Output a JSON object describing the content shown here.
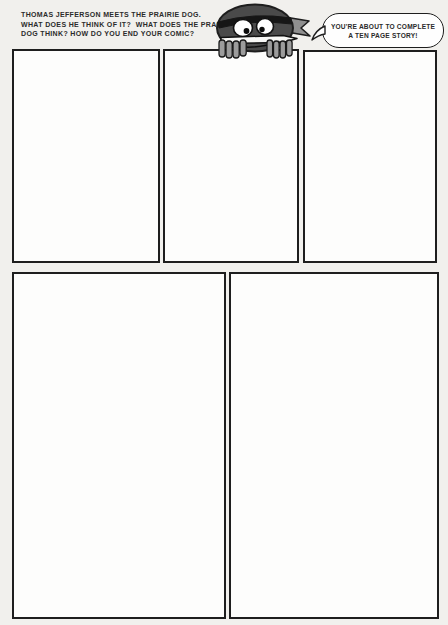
{
  "colors": {
    "page-bg": "#f1f0ed",
    "panel-bg": "#fdfdfc",
    "ink": "#1e1e1e",
    "text": "#2b2b2b",
    "char-body": "#4a4a4a",
    "char-dark": "#161616",
    "char-hand": "#9c9c9c",
    "char-tail": "#8f8f8f",
    "eye-white": "#ffffff",
    "blade": "#f8f8f6",
    "bubble-bg": "#fefefe"
  },
  "prompt": {
    "lines": [
      "THOMAS JEFFERSON MEETS THE PRAIRIE DOG.",
      "WHAT DOES HE THINK OF IT?  WHAT DOES THE PRAIRIE",
      "DOG THINK? HOW DO YOU END YOUR COMIC?"
    ]
  },
  "speech_bubble": {
    "lines": [
      "YOU'RE ABOUT TO COMPLETE",
      "A TEN PAGE STORY!"
    ]
  },
  "character": {
    "icon": "bandana-knife-mascot"
  },
  "panels": {
    "count": 5,
    "ids": [
      "panel-1",
      "panel-2",
      "panel-3",
      "panel-4",
      "panel-5"
    ]
  }
}
